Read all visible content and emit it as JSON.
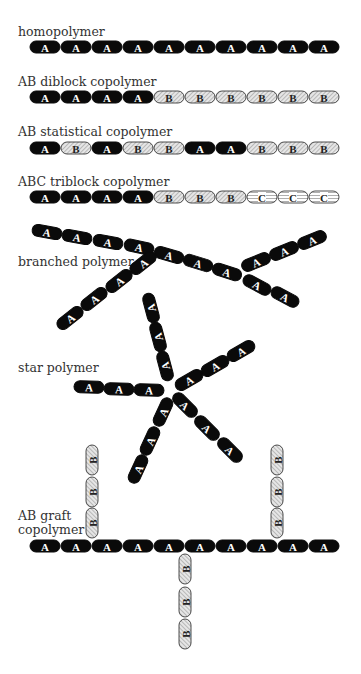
{
  "colors": {
    "A_fill": "#0a0a0a",
    "A_text": "#ffffff",
    "B_fill": "#e6e6e6",
    "B_hatch": "#8a8a8a",
    "C_fill": "#ffffff",
    "C_line": "#8a8a8a",
    "outline": "#222222",
    "label": "#333333"
  },
  "bead": {
    "length": 31,
    "height": 12
  },
  "linear_polymers": [
    {
      "name": "homopolymer",
      "label": "homopolymer",
      "label_x": 18,
      "label_y": 36,
      "x0": 45,
      "y": 47,
      "sequence": [
        "A",
        "A",
        "A",
        "A",
        "A",
        "A",
        "A",
        "A",
        "A",
        "A"
      ]
    },
    {
      "name": "ab-diblock",
      "label": "AB diblock copolymer",
      "label_x": 18,
      "label_y": 86,
      "x0": 45,
      "y": 97,
      "sequence": [
        "A",
        "A",
        "A",
        "A",
        "B",
        "B",
        "B",
        "B",
        "B",
        "B"
      ]
    },
    {
      "name": "ab-statistical",
      "label": "AB statistical copolymer",
      "label_x": 18,
      "label_y": 136,
      "x0": 45,
      "y": 148,
      "sequence": [
        "A",
        "B",
        "A",
        "B",
        "B",
        "A",
        "A",
        "B",
        "B",
        "B"
      ]
    },
    {
      "name": "abc-triblock",
      "label": "ABC triblock copolymer",
      "label_x": 18,
      "label_y": 186,
      "x0": 45,
      "y": 197,
      "sequence": [
        "A",
        "A",
        "A",
        "A",
        "B",
        "B",
        "B",
        "C",
        "C",
        "C"
      ]
    }
  ],
  "branched_polymer": {
    "label": "branched polymer",
    "label_x": 18,
    "label_y": 266,
    "beads": [
      {
        "t": "A",
        "x": 47,
        "y": 232,
        "r": 10
      },
      {
        "t": "A",
        "x": 77,
        "y": 237,
        "r": 10
      },
      {
        "t": "A",
        "x": 108,
        "y": 242,
        "r": 10
      },
      {
        "t": "A",
        "x": 139,
        "y": 247,
        "r": 12
      },
      {
        "t": "A",
        "x": 169,
        "y": 255,
        "r": 16
      },
      {
        "t": "A",
        "x": 198,
        "y": 263,
        "r": 17
      },
      {
        "t": "A",
        "x": 227,
        "y": 272,
        "r": 18
      },
      {
        "t": "A",
        "x": 257,
        "y": 285,
        "r": 28
      },
      {
        "t": "A",
        "x": 285,
        "y": 297,
        "r": 28
      },
      {
        "t": "A",
        "x": 256,
        "y": 262,
        "r": -22
      },
      {
        "t": "A",
        "x": 284,
        "y": 251,
        "r": -22
      },
      {
        "t": "A",
        "x": 312,
        "y": 240,
        "r": -22
      },
      {
        "t": "A",
        "x": 143,
        "y": 263,
        "r": -38
      },
      {
        "t": "A",
        "x": 119,
        "y": 281,
        "r": -38
      },
      {
        "t": "A",
        "x": 94,
        "y": 299,
        "r": -38
      },
      {
        "t": "A",
        "x": 70,
        "y": 318,
        "r": -38
      }
    ]
  },
  "star_polymer": {
    "label": "star polymer",
    "label_x": 18,
    "label_y": 372,
    "beads": [
      {
        "t": "A",
        "x": 89,
        "y": 387,
        "r": 2
      },
      {
        "t": "A",
        "x": 119,
        "y": 389,
        "r": 2
      },
      {
        "t": "A",
        "x": 149,
        "y": 390,
        "r": 2
      },
      {
        "t": "A",
        "x": 151,
        "y": 308,
        "r": -105
      },
      {
        "t": "A",
        "x": 158,
        "y": 337,
        "r": -105
      },
      {
        "t": "A",
        "x": 165,
        "y": 366,
        "r": -105
      },
      {
        "t": "A",
        "x": 189,
        "y": 380,
        "r": -30
      },
      {
        "t": "A",
        "x": 215,
        "y": 366,
        "r": -30
      },
      {
        "t": "A",
        "x": 241,
        "y": 351,
        "r": -30
      },
      {
        "t": "A",
        "x": 185,
        "y": 405,
        "r": 45
      },
      {
        "t": "A",
        "x": 207,
        "y": 428,
        "r": 45
      },
      {
        "t": "A",
        "x": 230,
        "y": 450,
        "r": 45
      },
      {
        "t": "A",
        "x": 163,
        "y": 412,
        "r": -65
      },
      {
        "t": "A",
        "x": 150,
        "y": 441,
        "r": -65
      },
      {
        "t": "A",
        "x": 138,
        "y": 469,
        "r": -65
      }
    ]
  },
  "graft_copolymer": {
    "label_line1": "AB graft",
    "label_line2": "copolymer",
    "label_x": 18,
    "label_y1": 520,
    "label_y2": 534,
    "backbone": {
      "x0": 45,
      "y": 546,
      "sequence": [
        "A",
        "A",
        "A",
        "A",
        "A",
        "A",
        "A",
        "A",
        "A",
        "A"
      ]
    },
    "grafts": [
      {
        "name": "left-graft",
        "x": 92,
        "ys": [
          460,
          492,
          523
        ],
        "sequence": [
          "B",
          "B",
          "B"
        ]
      },
      {
        "name": "right-graft",
        "x": 277,
        "ys": [
          460,
          492,
          523
        ],
        "sequence": [
          "B",
          "B",
          "B"
        ]
      },
      {
        "name": "bottom-graft",
        "x": 185,
        "ys": [
          569,
          602,
          634
        ],
        "sequence": [
          "B",
          "B",
          "B"
        ]
      }
    ]
  }
}
